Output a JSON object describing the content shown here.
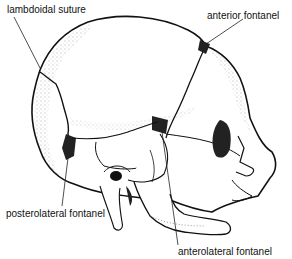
{
  "diagram": {
    "labels": [
      {
        "id": "lambdoidal",
        "text": "lambdoidal suture"
      },
      {
        "id": "anterior",
        "text": "anterior fontanel"
      },
      {
        "id": "posterolateral",
        "text": "posterolateral fontanel"
      },
      {
        "id": "anterolateral",
        "text": "anterolateral fontanel"
      }
    ],
    "colors": {
      "line": "#111111",
      "fill": "#ffffff",
      "shade": "#333333"
    }
  }
}
